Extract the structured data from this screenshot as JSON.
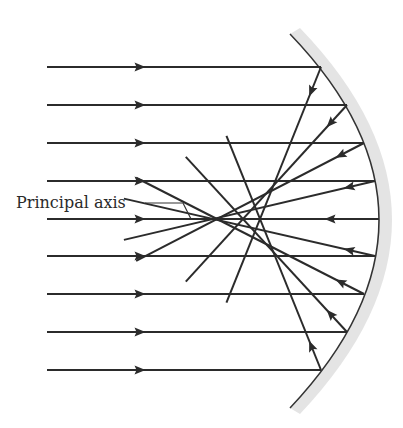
{
  "diagram": {
    "label": "Principal axis",
    "colors": {
      "ray": "#2b2b2b",
      "mirror": "#333333",
      "mirror_shadow": "#cfcfcf",
      "background": "#ffffff"
    },
    "incoming_rays_y": [
      67,
      105,
      143,
      181,
      219,
      256,
      294,
      332,
      370
    ],
    "ray_start_x": 47,
    "mirror": {
      "top": [
        290,
        34
      ],
      "vertex": [
        379,
        219
      ],
      "bottom": [
        290,
        408
      ]
    },
    "reflection_points": [
      [
        321,
        67
      ],
      [
        347,
        105
      ],
      [
        364,
        143
      ],
      [
        375,
        181
      ],
      [
        379,
        219
      ],
      [
        375,
        256
      ],
      [
        364,
        294
      ],
      [
        347,
        332
      ],
      [
        321,
        370
      ]
    ],
    "axis_crossings": [
      260,
      243,
      217,
      213,
      213,
      213,
      217,
      243,
      260
    ]
  }
}
